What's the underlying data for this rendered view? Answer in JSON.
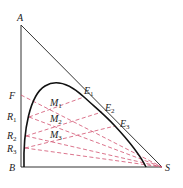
{
  "diagram": {
    "type": "ternary-phase-diagram",
    "vertices": {
      "A": {
        "label": "A",
        "x": 21,
        "y": 25
      },
      "B": {
        "label": "B",
        "x": 21,
        "y": 167
      },
      "S": {
        "label": "S",
        "x": 162,
        "y": 167
      }
    },
    "points": {
      "F": {
        "label": "F",
        "sub": "",
        "x": 21,
        "y": 95
      },
      "R1": {
        "label": "R",
        "sub": "1",
        "x": 29,
        "y": 117
      },
      "R2": {
        "label": "R",
        "sub": "2",
        "x": 26,
        "y": 136
      },
      "R3": {
        "label": "R",
        "sub": "3",
        "x": 25,
        "y": 148
      },
      "E1": {
        "label": "E",
        "sub": "1",
        "x": 84,
        "y": 97
      },
      "E2": {
        "label": "E",
        "sub": "2",
        "x": 102,
        "y": 112
      },
      "E3": {
        "label": "E",
        "sub": "3",
        "x": 115,
        "y": 126
      },
      "M1": {
        "label": "M",
        "sub": "1",
        "x": 55,
        "y": 102
      },
      "M2": {
        "label": "M",
        "sub": "2",
        "x": 55,
        "y": 118
      },
      "M3": {
        "label": "M",
        "sub": "3",
        "x": 55,
        "y": 133
      }
    },
    "colors": {
      "outline": "#222222",
      "curve": "#111111",
      "dashed": "#d2506e"
    }
  }
}
